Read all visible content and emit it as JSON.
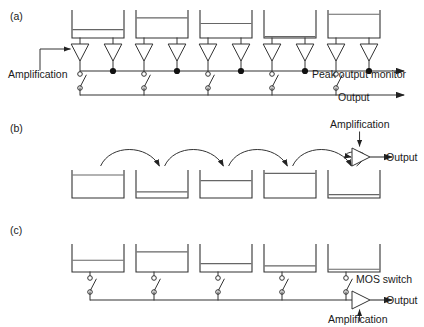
{
  "figure": {
    "background": "#ffffff",
    "ink": "#333333"
  },
  "panels": [
    {
      "id": "a",
      "label": "(a)",
      "label_x": 10,
      "label_y": 20,
      "type": "per-pixel-amplifier-bus",
      "description": "Each well feeds two amplifiers; one drives a switch onto the Output bus, the other taps the Peak output monitor bus.",
      "wells": [
        {
          "index": 0,
          "x": 72,
          "width": 52,
          "top": 10,
          "bottom": 38,
          "fill_level": 0.3
        },
        {
          "index": 1,
          "x": 136,
          "width": 52,
          "top": 10,
          "bottom": 38,
          "fill_level": 0.72
        },
        {
          "index": 2,
          "x": 200,
          "width": 52,
          "top": 10,
          "bottom": 38,
          "fill_level": 0.52
        },
        {
          "index": 3,
          "x": 264,
          "width": 52,
          "top": 10,
          "bottom": 38,
          "fill_level": 0.05
        },
        {
          "index": 4,
          "x": 328,
          "width": 52,
          "top": 10,
          "bottom": 38,
          "fill_level": 0.85
        }
      ],
      "amplifiers": [
        {
          "index": 0,
          "pair": "left",
          "cx": 80,
          "top": 44,
          "size": 17
        },
        {
          "index": 0,
          "pair": "right",
          "cx": 113,
          "top": 44,
          "size": 17
        },
        {
          "index": 1,
          "pair": "left",
          "cx": 144,
          "top": 44,
          "size": 17
        },
        {
          "index": 1,
          "pair": "right",
          "cx": 177,
          "top": 44,
          "size": 17
        },
        {
          "index": 2,
          "pair": "left",
          "cx": 208,
          "top": 44,
          "size": 17
        },
        {
          "index": 2,
          "pair": "right",
          "cx": 241,
          "top": 44,
          "size": 17
        },
        {
          "index": 3,
          "pair": "left",
          "cx": 272,
          "top": 44,
          "size": 17
        },
        {
          "index": 3,
          "pair": "right",
          "cx": 305,
          "top": 44,
          "size": 17
        },
        {
          "index": 4,
          "pair": "left",
          "cx": 336,
          "top": 44,
          "size": 17
        },
        {
          "index": 4,
          "pair": "right",
          "cx": 369,
          "top": 44,
          "size": 17
        }
      ],
      "monitor_bus": {
        "y": 71,
        "x_start": 80,
        "x_end": 404,
        "arrow": true
      },
      "monitor_nodes_x": [
        113,
        177,
        241,
        305,
        369
      ],
      "output_bus": {
        "y": 95,
        "x_start": 80,
        "x_end": 404,
        "arrow": true
      },
      "switches_x": [
        80,
        144,
        208,
        272,
        336
      ],
      "switch": {
        "top_y": 74,
        "bottom_y": 88
      },
      "annotations": [
        {
          "name": "amplification",
          "text": "Amplification",
          "x": 8,
          "y": 78,
          "anchor": "start"
        },
        {
          "name": "peak-output-monitor",
          "text": "Peak output monitor",
          "x": 312,
          "y": 78,
          "anchor": "start"
        },
        {
          "name": "output",
          "text": "Output",
          "x": 338,
          "y": 101,
          "anchor": "start"
        }
      ]
    },
    {
      "id": "b",
      "label": "(b)",
      "label_x": 10,
      "label_y": 132,
      "type": "charge-transfer-bucket-brigade",
      "description": "Charge is shifted bucket to bucket along the register and read out through a single amplifier.",
      "wells": [
        {
          "index": 0,
          "x": 72,
          "width": 52,
          "top": 170,
          "bottom": 198,
          "fill_level": 0.82
        },
        {
          "index": 1,
          "x": 136,
          "width": 52,
          "top": 170,
          "bottom": 198,
          "fill_level": 0.22
        },
        {
          "index": 2,
          "x": 200,
          "width": 52,
          "top": 170,
          "bottom": 198,
          "fill_level": 0.62
        },
        {
          "index": 3,
          "x": 264,
          "width": 52,
          "top": 170,
          "bottom": 198,
          "fill_level": 0.88
        },
        {
          "index": 4,
          "x": 328,
          "width": 52,
          "top": 170,
          "bottom": 198,
          "fill_level": 0.12
        }
      ],
      "transfer_arrows": [
        {
          "from_index": 0,
          "to_index": 1
        },
        {
          "from_index": 1,
          "to_index": 2
        },
        {
          "from_index": 2,
          "to_index": 3
        },
        {
          "from_index": 3,
          "to_index": 4
        },
        {
          "from_index": 4,
          "to_index": "amplifier"
        }
      ],
      "amplifier": {
        "x": 352,
        "y": 148,
        "width": 18,
        "height": 18,
        "direction": "right"
      },
      "annotations": [
        {
          "name": "amplification",
          "text": "Amplification",
          "x": 330,
          "y": 128,
          "anchor": "start"
        },
        {
          "name": "output",
          "text": "Output",
          "x": 386,
          "y": 161,
          "anchor": "start"
        }
      ]
    },
    {
      "id": "c",
      "label": "(c)",
      "label_x": 10,
      "label_y": 234,
      "type": "switched-bus-single-amplifier",
      "description": "Each well connects through a MOS switch to a common bus feeding one output amplifier.",
      "wells": [
        {
          "index": 0,
          "x": 72,
          "width": 52,
          "top": 244,
          "bottom": 272,
          "fill_level": 0.42
        },
        {
          "index": 1,
          "x": 136,
          "width": 52,
          "top": 244,
          "bottom": 272,
          "fill_level": 0.72
        },
        {
          "index": 2,
          "x": 200,
          "width": 52,
          "top": 244,
          "bottom": 272,
          "fill_level": 0.3
        },
        {
          "index": 3,
          "x": 264,
          "width": 52,
          "top": 244,
          "bottom": 272,
          "fill_level": 0.22
        },
        {
          "index": 4,
          "x": 328,
          "width": 52,
          "top": 244,
          "bottom": 272,
          "fill_level": 0.1
        }
      ],
      "switches_x": [
        90,
        154,
        218,
        282,
        346
      ],
      "switch": {
        "top_y": 278,
        "bottom_y": 292
      },
      "bus": {
        "y": 300,
        "x_start": 90,
        "x_end": 346
      },
      "amplifier": {
        "x": 352,
        "y": 291,
        "width": 18,
        "height": 18,
        "direction": "right"
      },
      "annotations": [
        {
          "name": "mos-switch",
          "text": "MOS switch",
          "x": 356,
          "y": 283,
          "anchor": "start"
        },
        {
          "name": "output",
          "text": "Output",
          "x": 386,
          "y": 304,
          "anchor": "start"
        },
        {
          "name": "amplification",
          "text": "Amplification",
          "x": 328,
          "y": 323,
          "anchor": "start"
        }
      ]
    }
  ]
}
